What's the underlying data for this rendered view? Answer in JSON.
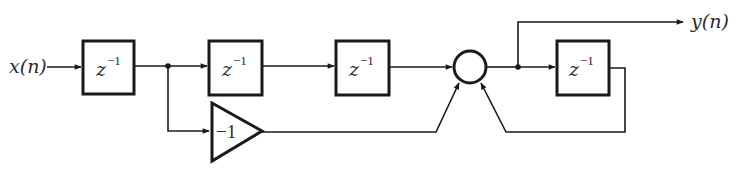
{
  "diagram": {
    "type": "signal-flow block diagram",
    "input_label": "x(n)",
    "output_label": "y(n)",
    "delay_label_base": "z",
    "delay_label_exp": "−1",
    "gain_label": "−1",
    "blocks": [
      {
        "id": "delay-1",
        "kind": "delay",
        "label": "z^-1"
      },
      {
        "id": "delay-2",
        "kind": "delay",
        "label": "z^-1"
      },
      {
        "id": "delay-3",
        "kind": "delay",
        "label": "z^-1"
      },
      {
        "id": "delay-4",
        "kind": "delay",
        "label": "z^-1"
      },
      {
        "id": "gain",
        "kind": "gain",
        "label": "-1"
      },
      {
        "id": "adder",
        "kind": "summing-junction",
        "label": ""
      }
    ],
    "colors": {
      "stroke": "#1a1a1a",
      "background": "#ffffff"
    }
  }
}
